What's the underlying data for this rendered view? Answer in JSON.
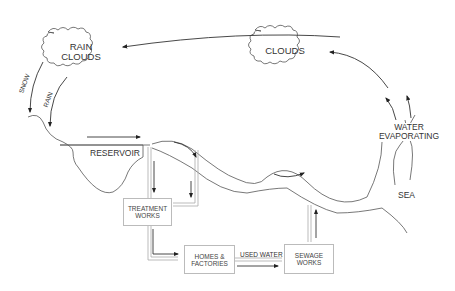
{
  "diagram": {
    "type": "water-cycle",
    "nodes": {
      "rain_clouds": {
        "line1": "RAIN",
        "line2": "CLOUDS"
      },
      "clouds": {
        "label": "CLOUDS"
      },
      "reservoir": {
        "label": "RESERVOIR"
      },
      "treatment_works": {
        "line1": "TREATMENT",
        "line2": "WORKS"
      },
      "homes_factories": {
        "line1": "HOMES &",
        "line2": "FACTORIES"
      },
      "sewage_works": {
        "line1": "SEWAGE",
        "line2": "WORKS"
      },
      "sea": {
        "label": "SEA"
      },
      "evaporation": {
        "line1": "WATER",
        "line2": "EVAPORATING"
      }
    },
    "edge_labels": {
      "snow": "SNOW",
      "rain": "RAIN",
      "used_water": "USED WATER"
    },
    "colors": {
      "line": "#333333",
      "box_border": "#bbbbbb",
      "text": "#333333"
    }
  }
}
